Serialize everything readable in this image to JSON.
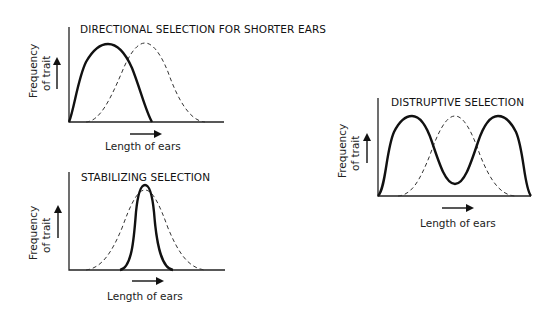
{
  "panels": [
    {
      "id": "directional",
      "title": "DIRECTIONAL SELECTION FOR SHORTER EARS",
      "ylabel_line1": "Frequency",
      "ylabel_line2": "of trait",
      "xlabel": "Length of ears"
    },
    {
      "id": "stabilizing",
      "title": "STABILIZING SELECTION",
      "ylabel_line1": "Frequency",
      "ylabel_line2": "of trait",
      "xlabel": "Length of ears"
    },
    {
      "id": "disruptive",
      "title": "DISTRUPTIVE SELECTION",
      "ylabel_line1": "Frequency",
      "ylabel_line2": "of trait",
      "xlabel": "Length of ears"
    }
  ],
  "legend": {
    "solid": "population after selection",
    "dashed": "original population"
  }
}
